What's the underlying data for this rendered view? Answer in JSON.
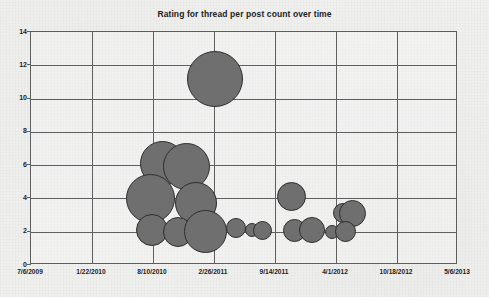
{
  "chart": {
    "title": "Rating for thread per post count over time"
  },
  "chart_data": {
    "type": "scatter",
    "subtype": "bubble",
    "title": "Rating for thread per post count over time",
    "xlabel": "",
    "ylabel": "",
    "grid": true,
    "legend": false,
    "legend_position": "none",
    "bubble_color": "#6f6f6f",
    "bubble_edge_color": "#2e2e2e",
    "plot_background": "#f1f1f0",
    "axis_color": "#5f5f5f",
    "xlim": [
      "7/6/2009",
      "5/6/2013"
    ],
    "ylim": [
      0,
      14
    ],
    "y_ticks": [
      0,
      2,
      4,
      6,
      8,
      10,
      12,
      14
    ],
    "y_tick_labels": [
      "0",
      "2",
      "4",
      "6",
      "8",
      "10",
      "12",
      "14"
    ],
    "x_ticks": [
      "7/6/2009",
      "1/22/2010",
      "8/10/2010",
      "2/26/2011",
      "9/14/2011",
      "4/1/2012",
      "10/18/2012",
      "5/6/2013"
    ],
    "x_tick_labels": [
      "7/6/2009",
      "1/22/2010",
      "8/10/2010",
      "2/26/2011",
      "9/14/2011",
      "4/1/2012",
      "10/18/2012",
      "5/6/2013"
    ],
    "x_tick_fractions": [
      0,
      0.1429,
      0.2857,
      0.4286,
      0.5714,
      0.7143,
      0.8571,
      1
    ],
    "points": [
      {
        "label": "bubble-1",
        "x_date": "9/12/2010",
        "x_frac": 0.309,
        "y": 6.1,
        "r_px": 22.5,
        "size": 30
      },
      {
        "label": "bubble-2",
        "x_date": "11/14/2010",
        "x_frac": 0.364,
        "y": 5.9,
        "r_px": 23.5,
        "size": 32
      },
      {
        "label": "bubble-3",
        "x_date": "8/2/2010",
        "x_frac": 0.281,
        "y": 4.0,
        "r_px": 24.5,
        "size": 35
      },
      {
        "label": "bubble-4",
        "x_date": "12/20/2010",
        "x_frac": 0.386,
        "y": 3.7,
        "r_px": 21.0,
        "size": 26
      },
      {
        "label": "bubble-5",
        "x_date": "8/8/2010",
        "x_frac": 0.284,
        "y": 2.1,
        "r_px": 16.0,
        "size": 15
      },
      {
        "label": "bubble-6",
        "x_date": "10/24/2010",
        "x_frac": 0.345,
        "y": 2.0,
        "r_px": 15.0,
        "size": 13
      },
      {
        "label": "bubble-7",
        "x_date": "1/16/2011",
        "x_frac": 0.409,
        "y": 2.0,
        "r_px": 21.5,
        "size": 27
      },
      {
        "label": "bubble-8",
        "x_date": "5/20/2011",
        "x_frac": 0.48,
        "y": 2.2,
        "r_px": 10.0,
        "size": 6
      },
      {
        "label": "bubble-9",
        "x_date": "7/5/2011",
        "x_frac": 0.518,
        "y": 2.1,
        "r_px": 7.0,
        "size": 3
      },
      {
        "label": "bubble-10",
        "x_date": "8/3/2011",
        "x_frac": 0.543,
        "y": 2.1,
        "r_px": 9.5,
        "size": 5
      },
      {
        "label": "bubble-11",
        "x_date": "6/2/2011",
        "x_frac": 0.43,
        "y": 11.2,
        "r_px": 28.0,
        "size": 45
      },
      {
        "label": "bubble-12",
        "x_date": "10/30/2011",
        "x_frac": 0.61,
        "y": 4.1,
        "r_px": 14.5,
        "size": 12
      },
      {
        "label": "bubble-13",
        "x_date": "11/5/2011",
        "x_frac": 0.618,
        "y": 2.1,
        "r_px": 11.5,
        "size": 8
      },
      {
        "label": "bubble-14",
        "x_date": "1/1/2012",
        "x_frac": 0.658,
        "y": 2.1,
        "r_px": 13.0,
        "size": 10
      },
      {
        "label": "bubble-15",
        "x_date": "3/20/2012",
        "x_frac": 0.706,
        "y": 2.0,
        "r_px": 7.0,
        "size": 3
      },
      {
        "label": "bubble-16",
        "x_date": "4/20/2012",
        "x_frac": 0.73,
        "y": 3.1,
        "r_px": 10.0,
        "size": 6
      },
      {
        "label": "bubble-17",
        "x_date": "5/25/2012",
        "x_frac": 0.752,
        "y": 3.1,
        "r_px": 13.5,
        "size": 11
      },
      {
        "label": "bubble-18",
        "x_date": "5/1/2012",
        "x_frac": 0.736,
        "y": 2.0,
        "r_px": 10.5,
        "size": 7
      }
    ]
  }
}
